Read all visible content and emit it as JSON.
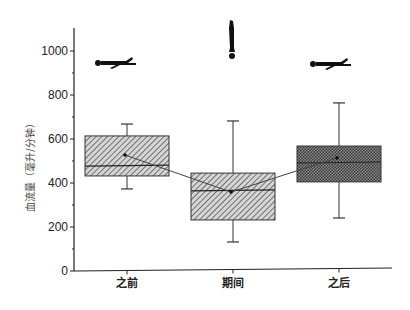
{
  "chart_data": {
    "type": "box",
    "title": "",
    "xlabel": "",
    "ylabel": "血流量（毫升/分钟）",
    "ylim": [
      0,
      1100
    ],
    "yticks": [
      0,
      200,
      400,
      600,
      800,
      1000
    ],
    "grid": false,
    "legend": null,
    "categories": [
      "之前",
      "期间",
      "之后"
    ],
    "boxes": [
      {
        "category": "之前",
        "whisker_low": 373,
        "q1": 432,
        "median": 477,
        "q3": 614,
        "whisker_high": 668,
        "mean": 527,
        "pattern": "diagonal-hatch",
        "icon": "lying-person"
      },
      {
        "category": "期间",
        "whisker_low": 132,
        "q1": 232,
        "median": 364,
        "q3": 445,
        "whisker_high": 682,
        "mean": 359,
        "pattern": "diagonal-hatch",
        "icon": "inverted-person"
      },
      {
        "category": "之后",
        "whisker_low": 241,
        "q1": 405,
        "median": 491,
        "q3": 568,
        "whisker_high": 764,
        "mean": 514,
        "pattern": "crosshatch-dark",
        "icon": "lying-person"
      }
    ],
    "mean_line": {
      "values": [
        527,
        359,
        514
      ],
      "style": "connecting line with arrow markers"
    },
    "annotations": [
      "lying-person silhouette above 之前",
      "upside-down person silhouette above 期间",
      "lying-person silhouette above 之后"
    ]
  },
  "colors": {
    "axis": "#222222",
    "hatch": "#555555",
    "box_fill_light": "#cfcfcf",
    "box_fill_dark": "#7a7a7a",
    "silhouette": "#111111"
  }
}
